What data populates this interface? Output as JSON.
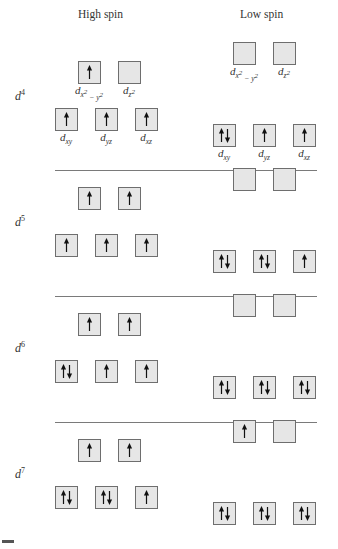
{
  "headers": {
    "high_spin": "High spin",
    "low_spin": "Low spin"
  },
  "orbital_labels": {
    "dx2y2": {
      "base": "d",
      "sub": "x",
      "sup1": "2",
      "mid": " − y",
      "sup2": "2"
    },
    "dz2": {
      "base": "d",
      "sub": "z",
      "sup": "2"
    },
    "dxy": {
      "base": "d",
      "sub": "xy"
    },
    "dyz": {
      "base": "d",
      "sub": "yz"
    },
    "dxz": {
      "base": "d",
      "sub": "xz"
    }
  },
  "configurations": [
    {
      "label": "d",
      "electrons": "4",
      "high_spin": {
        "eg": [
          "up",
          "empty"
        ],
        "t2g": [
          "up",
          "up",
          "up"
        ]
      },
      "low_spin": {
        "eg": [
          "empty",
          "empty"
        ],
        "t2g": [
          "pair",
          "up",
          "up"
        ]
      }
    },
    {
      "label": "d",
      "electrons": "5",
      "high_spin": {
        "eg": [
          "up",
          "up"
        ],
        "t2g": [
          "up",
          "up",
          "up"
        ]
      },
      "low_spin": {
        "eg": [
          "empty",
          "empty"
        ],
        "t2g": [
          "pair",
          "pair",
          "up"
        ]
      }
    },
    {
      "label": "d",
      "electrons": "6",
      "high_spin": {
        "eg": [
          "up",
          "up"
        ],
        "t2g": [
          "pair",
          "up",
          "up"
        ]
      },
      "low_spin": {
        "eg": [
          "empty",
          "empty"
        ],
        "t2g": [
          "pair",
          "pair",
          "pair"
        ]
      }
    },
    {
      "label": "d",
      "electrons": "7",
      "high_spin": {
        "eg": [
          "up",
          "up"
        ],
        "t2g": [
          "pair",
          "pair",
          "up"
        ]
      },
      "low_spin": {
        "eg": [
          "up",
          "empty"
        ],
        "t2g": [
          "pair",
          "pair",
          "pair"
        ]
      }
    }
  ],
  "colors": {
    "box_fill": "#e6e6e6",
    "box_border": "#6e6e6e",
    "arrow": "#111111",
    "separator": "#7a7a7a"
  }
}
